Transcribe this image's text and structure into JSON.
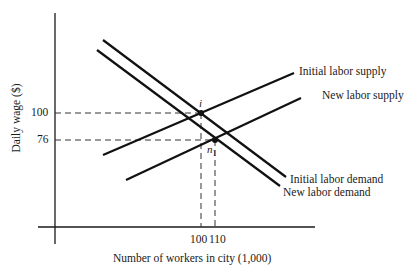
{
  "diagram": {
    "type": "supply-demand",
    "axes": {
      "xlabel": "Number of workers in city (1,000)",
      "ylabel": "Daily wage ($)",
      "x_ticks": [
        "100",
        "110"
      ],
      "y_ticks": [
        "100",
        "76"
      ]
    },
    "curves": [
      {
        "name": "Initial labor supply",
        "label": "Initial labor supply"
      },
      {
        "name": "New labor supply",
        "label": "New labor supply"
      },
      {
        "name": "Initial labor demand",
        "label": "Initial labor demand"
      },
      {
        "name": "New labor demand",
        "label": "New labor demand"
      }
    ],
    "points": [
      {
        "label": "i",
        "x": "100",
        "y": "100"
      },
      {
        "label": "n",
        "subscript": "1",
        "x": "110",
        "y": "76"
      }
    ]
  }
}
